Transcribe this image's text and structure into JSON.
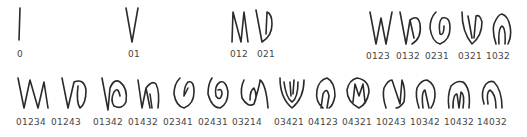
{
  "row1": [
    {
      "label": "0",
      "x": 6,
      "glyph": "line"
    },
    {
      "label": "01",
      "x": 128,
      "glyph": "v"
    },
    {
      "label": "012",
      "x": 232,
      "glyph": "n-v"
    },
    {
      "label": "021",
      "x": 259,
      "glyph": "v-loop"
    },
    {
      "label": "0123",
      "x": 365,
      "glyph": "w"
    },
    {
      "label": "0132",
      "x": 396,
      "glyph": "w-loop"
    },
    {
      "label": "0231",
      "x": 428,
      "glyph": "spiral"
    },
    {
      "label": "0321",
      "x": 461,
      "glyph": "v-nest"
    },
    {
      "label": "1032",
      "x": 491,
      "glyph": "arch"
    }
  ],
  "row2": [
    {
      "label": "01234",
      "x": 17,
      "glyph": "wv"
    },
    {
      "label": "01243",
      "x": 60,
      "glyph": "w-loop"
    },
    {
      "label": "01342",
      "x": 101,
      "glyph": "spiral-left"
    },
    {
      "label": "01432",
      "x": 136,
      "glyph": "v-arch"
    },
    {
      "label": "02341",
      "x": 172,
      "glyph": "spiral"
    },
    {
      "label": "02431",
      "x": 206,
      "glyph": "spiral"
    },
    {
      "label": "03214",
      "x": 239,
      "glyph": "spiral-open"
    },
    {
      "label": "03421",
      "x": 280,
      "glyph": "v-nest"
    },
    {
      "label": "04123",
      "x": 313,
      "glyph": "s-leaf"
    },
    {
      "label": "04321",
      "x": 347,
      "glyph": "m-leaf"
    },
    {
      "label": "10243",
      "x": 380,
      "glyph": "n-leaf"
    },
    {
      "label": "10342",
      "x": 413,
      "glyph": "arch"
    },
    {
      "label": "10432",
      "x": 445,
      "glyph": "arch-n"
    },
    {
      "label": "14032",
      "x": 478,
      "glyph": "arch-open"
    }
  ]
}
